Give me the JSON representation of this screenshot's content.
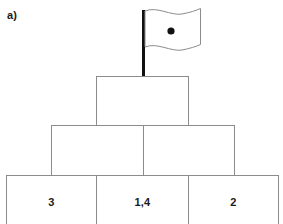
{
  "figure": {
    "part_label": "a)",
    "type": "number-pyramid"
  },
  "flag": {
    "icon": "wavy-flag-icon",
    "pole_color": "#111111",
    "banner_stroke": "#8c8c8c",
    "banner_fill": "#ffffff",
    "marker": {
      "icon": "filled-dot-icon",
      "color": "#111111"
    }
  },
  "pyramid": {
    "border_color": "#8c8c8c",
    "rows": [
      {
        "name": "apex-row",
        "cells": [
          {
            "name": "apex-cell",
            "value": ""
          }
        ]
      },
      {
        "name": "middle-row",
        "cells": [
          {
            "name": "middle-left-cell",
            "value": ""
          },
          {
            "name": "middle-right-cell",
            "value": ""
          }
        ]
      },
      {
        "name": "base-row",
        "cells": [
          {
            "name": "base-left-cell",
            "value": "3"
          },
          {
            "name": "base-center-cell",
            "value": "1,4"
          },
          {
            "name": "base-right-cell",
            "value": "2"
          }
        ]
      }
    ]
  }
}
